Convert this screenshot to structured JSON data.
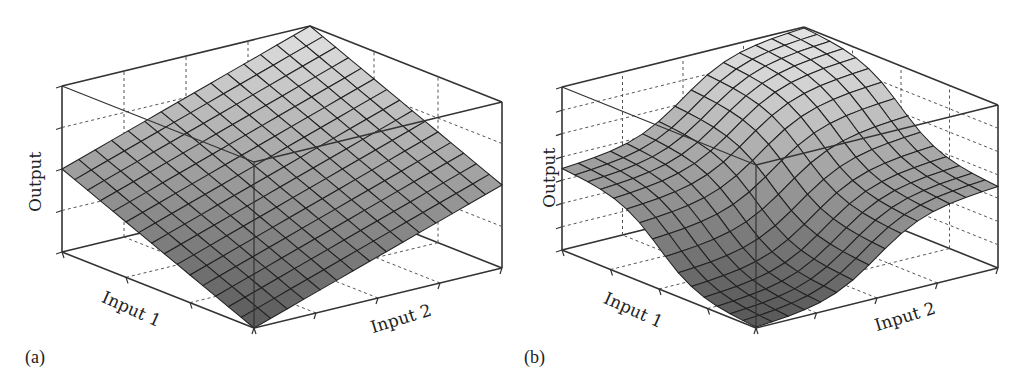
{
  "chart_data": [
    {
      "id": "a",
      "type": "surface3d",
      "panel_label": "(a)",
      "title": "",
      "xlabel": "Input 1",
      "ylabel": "Input 2",
      "zlabel": "Output",
      "grid": true,
      "surface": "planar (linear) surface, output increases linearly with both inputs",
      "mesh_size": [
        15,
        15
      ],
      "z_ticks_count": 5,
      "x_ticks_count": 3,
      "y_ticks_count": 4,
      "colormap": "grayscale (dark at low output, light at high output)"
    },
    {
      "id": "b",
      "type": "surface3d",
      "panel_label": "(b)",
      "title": "",
      "xlabel": "Input 1",
      "ylabel": "Input 2",
      "zlabel": "Output",
      "grid": true,
      "surface": "nonlinear star-shaped surface with four raised lobes and saddle regions",
      "mesh_size": [
        15,
        15
      ],
      "z_ticks_count": 8,
      "x_ticks_count": 4,
      "y_ticks_count": 4,
      "colormap": "grayscale (dark at low output, light at high output)"
    }
  ],
  "panels": {
    "a": {
      "label": "(a)",
      "xlabel": "Input 1",
      "ylabel": "Input 2",
      "zlabel": "Output"
    },
    "b": {
      "label": "(b)",
      "xlabel": "Input 1",
      "ylabel": "Input 2",
      "zlabel": "Output"
    }
  },
  "colors": {
    "frame": "#333333",
    "dashed_grid": "#555555",
    "surface_light": "#d6d6d6",
    "surface_dark": "#6e6e6e",
    "mesh": "#222222"
  }
}
